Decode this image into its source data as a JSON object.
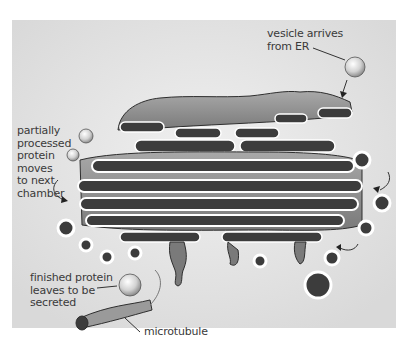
{
  "diagram": {
    "labels": {
      "vesicle_arrives": [
        "vesicle arrives",
        "from ER"
      ],
      "partially_processed": [
        "partially",
        "processed",
        "protein",
        "moves",
        "to next",
        "chamber"
      ],
      "finished_protein": [
        "finished protein",
        "leaves to be",
        "secreted"
      ],
      "microtubule": "microtubule"
    },
    "colors": {
      "background": "#e6e6e6",
      "membrane": "#8f8f8f",
      "lumen": "#3c3c3c",
      "outline": "#2e2e2e",
      "highlight": "#ffffff",
      "text": "#3a3a3a"
    }
  }
}
